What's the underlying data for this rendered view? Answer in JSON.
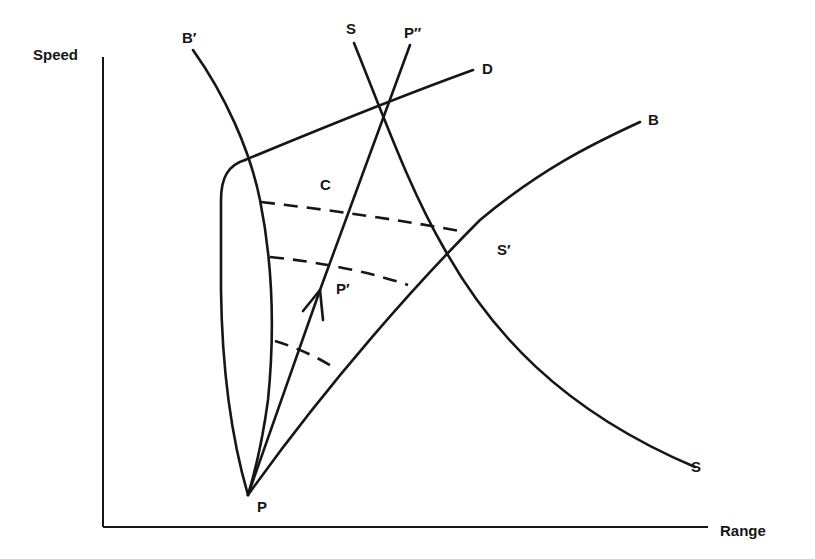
{
  "diagram": {
    "axes": {
      "y_label": "Speed",
      "x_label": "Range"
    },
    "curve_labels": {
      "b_prime": "B′",
      "s_top": "S",
      "p_double_prime": "P″",
      "d": "D",
      "b": "B",
      "c": "C",
      "s_prime": "S′",
      "p_prime": "P′",
      "s_bottom": "S",
      "p": "P"
    },
    "colors": {
      "ink": "#161616",
      "background": "#ffffff"
    }
  }
}
